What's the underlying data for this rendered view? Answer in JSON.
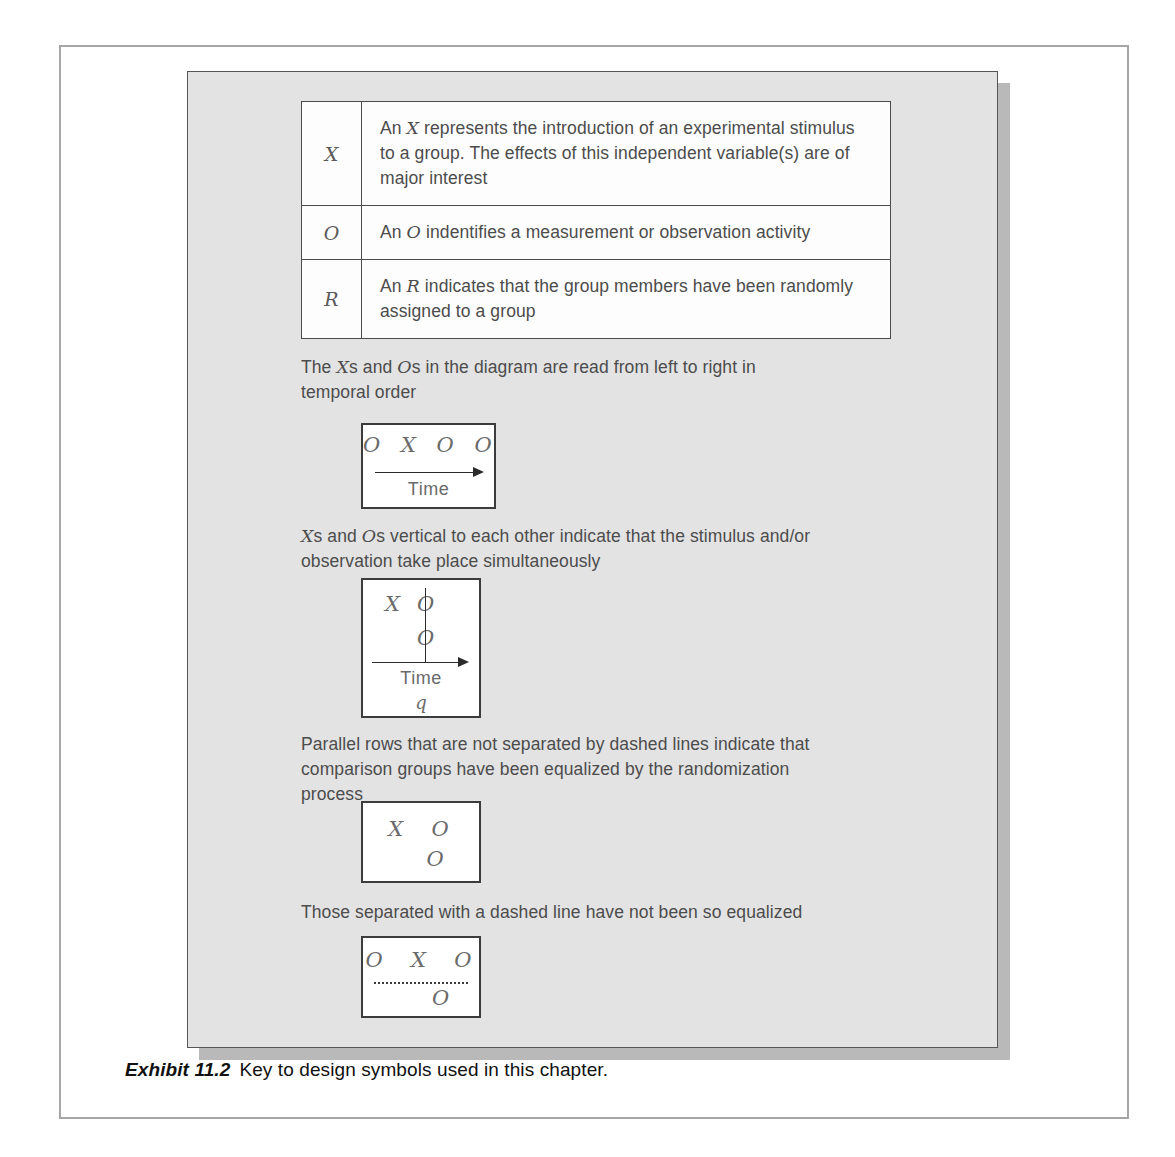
{
  "exhibit": {
    "caption_label": "Exhibit 11.2",
    "caption_text": "Key to design symbols used in this chapter."
  },
  "symbol_table": {
    "rows": [
      {
        "symbol": "X",
        "description_parts": {
          "lead": "An ",
          "symbol": "X",
          "rest": " represents the introduction of an experimental stimulus to a group. The effects of this independent variable(s) are of major interest"
        },
        "description": "An X represents the introduction of an experimental stimulus to a group. The effects of this independent variable(s) are of major interest"
      },
      {
        "symbol": "O",
        "description_parts": {
          "lead": "An ",
          "symbol": "O",
          "rest": " indentifies a measurement or observation activity"
        },
        "description": "An O indentifies a measurement or observation activity"
      },
      {
        "symbol": "R",
        "description_parts": {
          "lead": "An ",
          "symbol": "R",
          "rest": " indicates that the group members have been randomly assigned to a group"
        },
        "description": "An R indicates that the group members have been randomly assigned to a group"
      }
    ]
  },
  "notes": {
    "note1": {
      "lead": "The ",
      "sym_a": "X",
      "mid": "s and ",
      "sym_b": "O",
      "rest": "s in the diagram are read from left to right in temporal order",
      "full": "The Xs and Os in the diagram are read from left to right in temporal order"
    },
    "note2": {
      "sym_a": "X",
      "mid": "s and ",
      "sym_b": "O",
      "rest": "s vertical to each other indicate that the stimulus and/or observation take place simultaneously",
      "full": "Xs and Os vertical to each other indicate that the stimulus and/or observation take place simultaneously"
    },
    "note3": "Parallel rows that are not separated by dashed lines indicate that comparison groups have been equalized by the randomization process",
    "note4": "Those separated with a dashed line have not been so equalized"
  },
  "diagrams": {
    "diagram1": {
      "symbols": "O X O O",
      "time_label": "Time"
    },
    "diagram2": {
      "row1_x": "X",
      "row1_o": "O",
      "row2_o": "O",
      "time_label": "Time",
      "q_label": "q"
    },
    "diagram3": {
      "row1": "X  O",
      "row2": "O"
    },
    "diagram4": {
      "row1": "O  X  O",
      "row2": "O"
    }
  },
  "bleed_through": {
    "right_column": "",
    "bottom_strip": ""
  },
  "colors": {
    "panel_background": "#e3e3e3",
    "panel_shadow": "#b9b9b9",
    "box_border": "#3c3c3c",
    "body_text": "#4c4c4c",
    "symbol_text": "#6a6a6a",
    "frame_border": "#a6a6a6"
  }
}
